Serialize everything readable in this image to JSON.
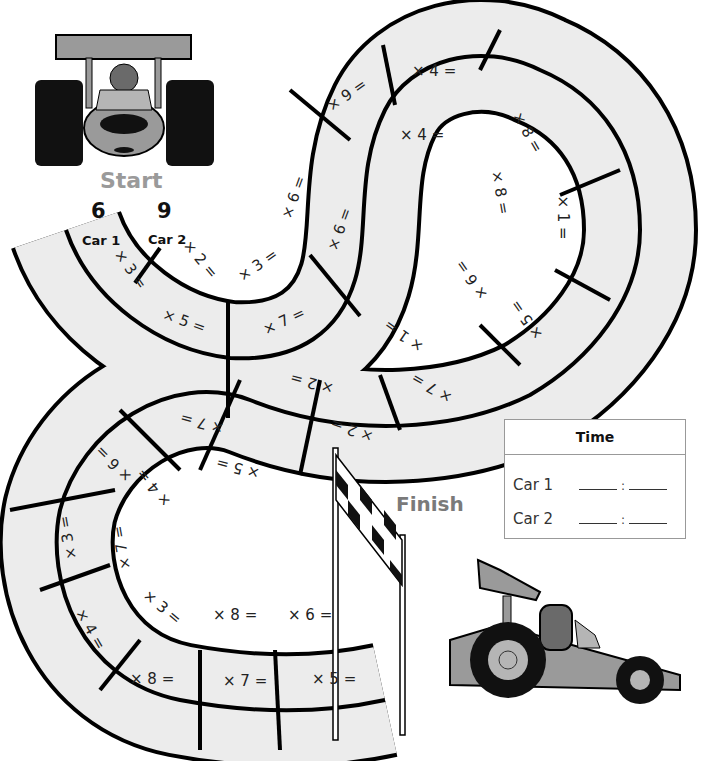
{
  "start": {
    "label": "Start",
    "car1_number": "6",
    "car2_number": "9",
    "car1_tag": "Car 1",
    "car2_tag": "Car 2"
  },
  "finish": {
    "label": "Finish"
  },
  "track": {
    "outer_lane": [
      {
        "label": "× 3 ="
      },
      {
        "label": "× 5 ="
      },
      {
        "label": "× 7 ="
      },
      {
        "label": "× 6 ="
      },
      {
        "label": "× 9 ="
      },
      {
        "label": "× 4 ="
      },
      {
        "label": "× 8 ="
      },
      {
        "label": "× 1 ="
      },
      {
        "label": "× 5 ="
      },
      {
        "label": "× 7 ="
      },
      {
        "label": "× 2 ="
      },
      {
        "label": "× 7 ="
      },
      {
        "label": "× 6 ="
      },
      {
        "label": "× 3 ="
      },
      {
        "label": "× 4 ="
      },
      {
        "label": "× 8 ="
      },
      {
        "label": "× 7 ="
      },
      {
        "label": "× 5 ="
      }
    ],
    "inner_lane": [
      {
        "label": "× 2 ="
      },
      {
        "label": "× 3 ="
      },
      {
        "label": "× 6 ="
      },
      {
        "label": "× 4 ="
      },
      {
        "label": "× 8 ="
      },
      {
        "label": "× 6 ="
      },
      {
        "label": "× 1 ="
      },
      {
        "label": "× 2 ="
      },
      {
        "label": "× 5 ="
      },
      {
        "label": "× 4 ="
      },
      {
        "label": "× 7 ="
      },
      {
        "label": "× 3 ="
      },
      {
        "label": "× 8 ="
      },
      {
        "label": "× 6 ="
      }
    ]
  },
  "time_box": {
    "header": "Time",
    "rows": [
      {
        "label": "Car 1",
        "sep": ":"
      },
      {
        "label": "Car 2",
        "sep": ":"
      }
    ]
  },
  "colors": {
    "track_fill": "#ececec",
    "track_line": "#000000",
    "start_text": "#9a9a9a",
    "finish_text": "#7a7a7a",
    "car_body": "#9a9a9a"
  }
}
